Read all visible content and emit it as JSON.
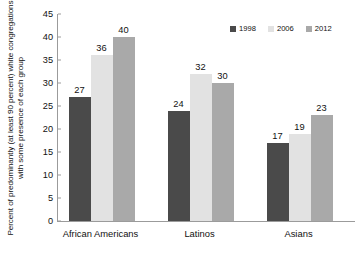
{
  "chart_data": {
    "type": "bar",
    "title": "",
    "subtitle": "",
    "xlabel": "",
    "ylabel": "Percent of predominantly (at least 90 percent) white congregations with some presence of each group",
    "categories": [
      "African Americans",
      "Latinos",
      "Asians"
    ],
    "series": [
      {
        "name": "1998",
        "color": "#4a4a4a",
        "values": [
          27,
          24,
          17
        ]
      },
      {
        "name": "2006",
        "color": "#e2e2e2",
        "values": [
          36,
          32,
          19
        ]
      },
      {
        "name": "2012",
        "color": "#a9a9a9",
        "values": [
          40,
          30,
          23
        ]
      }
    ],
    "ylim": [
      0,
      45
    ],
    "ytick_labels": [
      "0",
      "5",
      "10",
      "15",
      "20",
      "25",
      "30",
      "35",
      "40",
      "45"
    ],
    "ytick_values": [
      0,
      5,
      10,
      15,
      20,
      25,
      30,
      35,
      40,
      45
    ],
    "grid": false,
    "legend_position": "top-right",
    "data_labels": true,
    "axis_color": "#9b9b9b",
    "background": "#ffffff"
  },
  "legend": {
    "items": [
      {
        "label": "1998",
        "color": "#4a4a4a"
      },
      {
        "label": "2006",
        "color": "#e2e2e2"
      },
      {
        "label": "2012",
        "color": "#a9a9a9"
      }
    ]
  }
}
